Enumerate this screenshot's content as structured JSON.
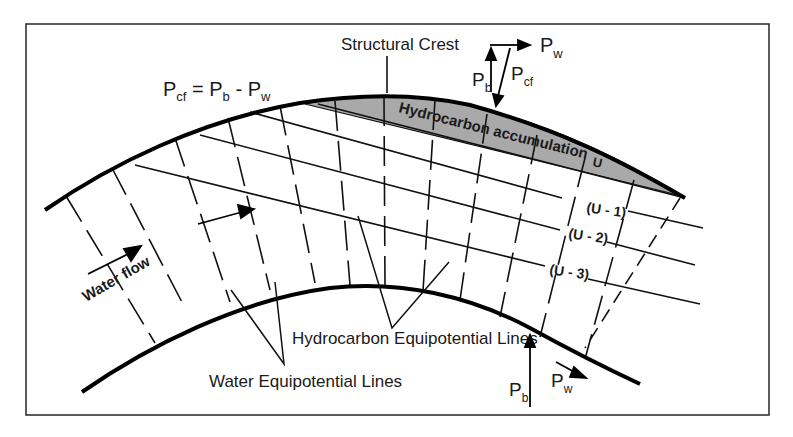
{
  "figure": {
    "labels": {
      "structural_crest": "Structural Crest",
      "equation": {
        "lhs_main": "P",
        "lhs_sub": "cf",
        "eq": " = ",
        "term1_main": "P",
        "term1_sub": "b",
        "minus": " - ",
        "term2_main": "P",
        "term2_sub": "w"
      },
      "hydrocarbon_accumulation": "Hydrocarbon accumulation",
      "u_label": "U",
      "u_minus_1": "(U - 1)",
      "u_minus_2": "(U - 2)",
      "u_minus_3": "(U - 3)",
      "water_flow": "Water flow",
      "hydrocarbon_equipotential_lines": "Hydrocarbon Equipotential Lines",
      "water_equipotential_lines": "Water Equipotential Lines"
    },
    "vector_diagram_top": {
      "pw_main": "P",
      "pw_sub": "w",
      "pb_main": "P",
      "pb_sub": "b",
      "pcf_main": "P",
      "pcf_sub": "cf"
    },
    "vector_diagram_bottom": {
      "pb_main": "P",
      "pb_sub": "b",
      "pw_main": "P",
      "pw_sub": "w"
    },
    "colors": {
      "ink": "#111111",
      "accumulation_fill": "#a9a9a9",
      "frame": "#333333",
      "background": "#ffffff"
    }
  }
}
